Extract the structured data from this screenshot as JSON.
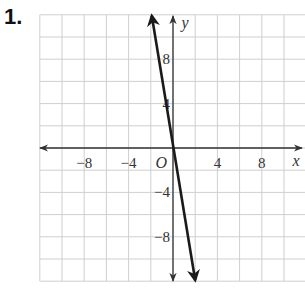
{
  "problem_number": "1.",
  "chart_data": {
    "type": "line",
    "title": "",
    "xlabel": "x",
    "ylabel": "y",
    "origin_label": "O",
    "xlim": [
      -12,
      12
    ],
    "ylim": [
      -12,
      12
    ],
    "grid": true,
    "grid_step": 2,
    "x_ticks": [
      -8,
      -4,
      4,
      8
    ],
    "x_tick_labels": [
      "−8",
      "−4",
      "4",
      "8"
    ],
    "y_ticks": [
      8,
      4,
      -4,
      -8
    ],
    "y_tick_labels": [
      "8",
      "4",
      "−4",
      "−8"
    ],
    "series": [
      {
        "name": "line",
        "equation": "y = -6x",
        "x": [
          -2,
          0,
          2
        ],
        "y": [
          12,
          0,
          -12
        ]
      }
    ]
  },
  "colors": {
    "grid": "#cfcfcf",
    "axis": "#333333",
    "line": "#1a1a1a"
  }
}
